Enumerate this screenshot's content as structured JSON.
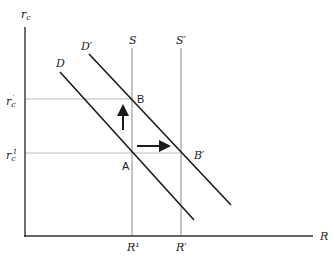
{
  "diagram": {
    "y_axis_label": {
      "main": "r",
      "sub": "c"
    },
    "x_axis_label": "R",
    "curves": {
      "demand": "D",
      "demand_shifted": "D′",
      "supply": "S",
      "supply_shifted": "S′"
    },
    "y_ticks": [
      {
        "main": "r",
        "sub": "c",
        "sup": "′"
      },
      {
        "main": "r",
        "sub": "c",
        "sup": "1"
      }
    ],
    "x_ticks": [
      "R¹",
      "R′"
    ],
    "points": {
      "A": "A",
      "B": "B",
      "B_prime": "B′"
    },
    "colors": {
      "axis": "#333333",
      "curve": "#1a1a1a",
      "supply": "#888888",
      "guide": "#bbbbbb"
    }
  }
}
